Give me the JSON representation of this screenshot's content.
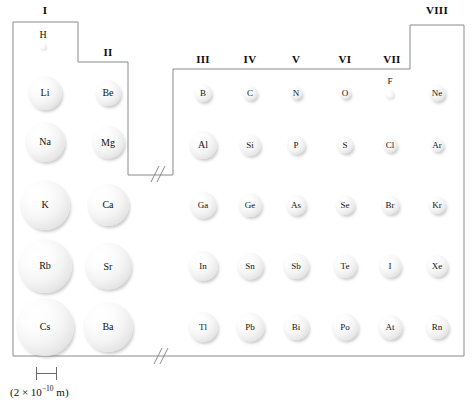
{
  "figure": {
    "type": "periodic-table-atomic-radii",
    "scale": {
      "caption_prefix": "(2 ",
      "caption_times": "×",
      "caption_base": " 10",
      "caption_exp": "−10",
      "caption_suffix": " m)",
      "caption_full": "(2 × 10⁻¹⁰ m)",
      "bar_px": 21
    }
  },
  "group_headers": [
    {
      "label": "I",
      "x": 45,
      "y": 4
    },
    {
      "label": "II",
      "x": 108,
      "y": 46
    },
    {
      "label": "III",
      "x": 203,
      "y": 53
    },
    {
      "label": "IV",
      "x": 250,
      "y": 53
    },
    {
      "label": "V",
      "x": 296,
      "y": 53
    },
    {
      "label": "VI",
      "x": 345,
      "y": 53
    },
    {
      "label": "VII",
      "x": 392,
      "y": 53
    },
    {
      "label": "VIII",
      "x": 437,
      "y": 4
    }
  ],
  "atoms": [
    {
      "symbol": "H",
      "x": 43,
      "y": 47,
      "d": 7,
      "fs": 10,
      "label_outside": true
    },
    {
      "symbol": "Li",
      "x": 45,
      "y": 93,
      "d": 34,
      "fs": 10
    },
    {
      "symbol": "Be",
      "x": 108,
      "y": 93,
      "d": 26,
      "fs": 10
    },
    {
      "symbol": "B",
      "x": 203,
      "y": 93,
      "d": 18,
      "fs": 9
    },
    {
      "symbol": "C",
      "x": 250,
      "y": 93,
      "d": 15,
      "fs": 9
    },
    {
      "symbol": "N",
      "x": 296,
      "y": 93,
      "d": 13,
      "fs": 9
    },
    {
      "symbol": "O",
      "x": 345,
      "y": 93,
      "d": 12,
      "fs": 9
    },
    {
      "symbol": "F",
      "x": 390,
      "y": 95,
      "d": 9,
      "fs": 9,
      "label_outside": true
    },
    {
      "symbol": "Ne",
      "x": 437,
      "y": 93,
      "d": 17,
      "fs": 9
    },
    {
      "symbol": "Na",
      "x": 45,
      "y": 142,
      "d": 40,
      "fs": 10
    },
    {
      "symbol": "Mg",
      "x": 108,
      "y": 142,
      "d": 33,
      "fs": 10
    },
    {
      "symbol": "Al",
      "x": 203,
      "y": 145,
      "d": 28,
      "fs": 10
    },
    {
      "symbol": "Si",
      "x": 250,
      "y": 145,
      "d": 22,
      "fs": 9
    },
    {
      "symbol": "P",
      "x": 296,
      "y": 145,
      "d": 19,
      "fs": 9
    },
    {
      "symbol": "S",
      "x": 345,
      "y": 145,
      "d": 17,
      "fs": 9
    },
    {
      "symbol": "Cl",
      "x": 390,
      "y": 145,
      "d": 15,
      "fs": 9
    },
    {
      "symbol": "Ar",
      "x": 437,
      "y": 145,
      "d": 14,
      "fs": 9
    },
    {
      "symbol": "K",
      "x": 45,
      "y": 205,
      "d": 50,
      "fs": 10
    },
    {
      "symbol": "Ca",
      "x": 108,
      "y": 205,
      "d": 42,
      "fs": 10
    },
    {
      "symbol": "Ga",
      "x": 203,
      "y": 205,
      "d": 27,
      "fs": 9
    },
    {
      "symbol": "Ge",
      "x": 250,
      "y": 205,
      "d": 24,
      "fs": 9
    },
    {
      "symbol": "As",
      "x": 296,
      "y": 205,
      "d": 21,
      "fs": 9
    },
    {
      "symbol": "Se",
      "x": 345,
      "y": 205,
      "d": 20,
      "fs": 9
    },
    {
      "symbol": "Br",
      "x": 390,
      "y": 205,
      "d": 19,
      "fs": 9
    },
    {
      "symbol": "Kr",
      "x": 437,
      "y": 205,
      "d": 18,
      "fs": 9
    },
    {
      "symbol": "Rb",
      "x": 45,
      "y": 266,
      "d": 54,
      "fs": 10
    },
    {
      "symbol": "Sr",
      "x": 108,
      "y": 266,
      "d": 47,
      "fs": 10
    },
    {
      "symbol": "In",
      "x": 203,
      "y": 266,
      "d": 30,
      "fs": 9
    },
    {
      "symbol": "Sn",
      "x": 250,
      "y": 266,
      "d": 27,
      "fs": 9
    },
    {
      "symbol": "Sb",
      "x": 296,
      "y": 266,
      "d": 26,
      "fs": 9
    },
    {
      "symbol": "Te",
      "x": 345,
      "y": 266,
      "d": 24,
      "fs": 9
    },
    {
      "symbol": "I",
      "x": 390,
      "y": 266,
      "d": 23,
      "fs": 9
    },
    {
      "symbol": "Xe",
      "x": 437,
      "y": 266,
      "d": 22,
      "fs": 9
    },
    {
      "symbol": "Cs",
      "x": 45,
      "y": 327,
      "d": 58,
      "fs": 10
    },
    {
      "symbol": "Ba",
      "x": 108,
      "y": 327,
      "d": 50,
      "fs": 10
    },
    {
      "symbol": "Tl",
      "x": 203,
      "y": 327,
      "d": 30,
      "fs": 9
    },
    {
      "symbol": "Pb",
      "x": 250,
      "y": 327,
      "d": 29,
      "fs": 9
    },
    {
      "symbol": "Bi",
      "x": 296,
      "y": 327,
      "d": 26,
      "fs": 9
    },
    {
      "symbol": "Po",
      "x": 345,
      "y": 327,
      "d": 27,
      "fs": 9
    },
    {
      "symbol": "At",
      "x": 390,
      "y": 327,
      "d": 25,
      "fs": 9
    },
    {
      "symbol": "Rn",
      "x": 437,
      "y": 327,
      "d": 24,
      "fs": 9
    }
  ]
}
